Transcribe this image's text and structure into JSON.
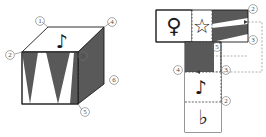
{
  "figure": {
    "colors": {
      "dark_fill": "#595959",
      "light_fill": "#ffffff",
      "solid_line": "#1a1a1a",
      "dashed_line": "#3d3d3d",
      "label_text": "#4a4a4a",
      "glyph": "#1a1a1a",
      "page_background": "#ffffff"
    }
  },
  "cube": {
    "name": "cube-diagram",
    "vertex_labels": [
      "1",
      "2",
      "3",
      "4",
      "5",
      "6"
    ],
    "faces": [
      {
        "name": "top-face",
        "content": "eighth-note",
        "glyph": "♪",
        "fill": "light"
      },
      {
        "name": "front-face",
        "content": "zigzag-triangles",
        "glyph": "",
        "fill": "patterned"
      },
      {
        "name": "right-face",
        "content": "solid",
        "glyph": "",
        "fill": "dark"
      }
    ]
  },
  "net": {
    "name": "unfolded-net",
    "vertex_labels": [
      "2",
      "3",
      "4",
      "5",
      "2",
      "3"
    ],
    "cells": [
      {
        "name": "net-cell-venus",
        "content": "venus-symbol",
        "glyph": "♀",
        "fill": "light"
      },
      {
        "name": "net-cell-star",
        "content": "star-outline",
        "glyph": "☆",
        "fill": "light"
      },
      {
        "name": "net-cell-zigzag",
        "content": "zigzag-triangles",
        "glyph": "",
        "fill": "patterned"
      },
      {
        "name": "net-cell-solid",
        "content": "solid",
        "glyph": "",
        "fill": "dark"
      },
      {
        "name": "net-cell-note",
        "content": "eighth-note",
        "glyph": "♪",
        "fill": "light"
      },
      {
        "name": "net-cell-flat",
        "content": "flat-symbol",
        "glyph": "♭",
        "fill": "light"
      }
    ]
  },
  "labels": {
    "c1": "1",
    "c2": "2",
    "c3": "3",
    "c4": "4",
    "c5": "5",
    "c6": "6",
    "n2a": "2",
    "n3a": "3",
    "n5": "5",
    "n4": "4",
    "n3b": "3",
    "n2b": "2"
  }
}
